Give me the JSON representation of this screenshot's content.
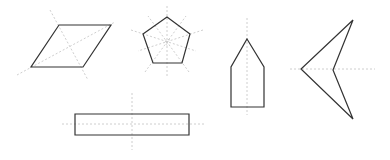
{
  "diagram": {
    "colors": {
      "outline": "#333333",
      "symmetry_line": "#c8c8c8",
      "background": "#ffffff"
    },
    "shapes": [
      {
        "name": "parallelogram",
        "points": "59,25 111,25 83,67 31,67",
        "symmetry_lines": [
          [
            50,
            10,
            88,
            80
          ],
          [
            17,
            75,
            115,
            22
          ]
        ]
      },
      {
        "name": "pentagon",
        "points": "167,17 190,34 182,63 153,63 143,34",
        "center": [
          167,
          42
        ],
        "symmetry_lines": [
          [
            167,
            6,
            167,
            78
          ],
          [
            131,
            30,
            196,
            51
          ],
          [
            203,
            30,
            138,
            51
          ],
          [
            145,
            72,
            186,
            16
          ],
          [
            189,
            72,
            148,
            16
          ]
        ]
      },
      {
        "name": "house-pentagon",
        "points": "247,39 264,67 264,107 231,107 231,67",
        "symmetry_lines": [
          [
            247,
            18,
            247,
            115
          ]
        ]
      },
      {
        "name": "arrowhead",
        "points": "353,20 333,70 353,119 301,69",
        "symmetry_lines": [
          [
            290,
            69,
            375,
            69
          ]
        ]
      },
      {
        "name": "rectangle",
        "points": "75,114 189,114 189,135 75,135",
        "symmetry_lines": [
          [
            132,
            93,
            132,
            150
          ],
          [
            62,
            124,
            206,
            124
          ]
        ]
      }
    ]
  }
}
